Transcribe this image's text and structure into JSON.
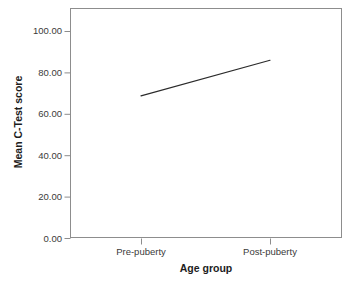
{
  "chart_data": {
    "type": "line",
    "title": "",
    "subtitle": "",
    "xlabel": "Age group",
    "ylabel": "Mean C-Test score",
    "categories": [
      "Pre-puberty",
      "Post-puberty"
    ],
    "series": [
      {
        "name": "Mean C-Test score",
        "values": [
          68.0,
          85.0
        ]
      }
    ],
    "ylim": [
      0.0,
      110.0
    ],
    "yticks": [
      0.0,
      20.0,
      40.0,
      60.0,
      80.0,
      100.0
    ],
    "ytick_labels": [
      "0.00",
      "20.00",
      "40.00",
      "60.00",
      "80.00",
      "100.00"
    ],
    "xtick_labels": [
      "Pre-puberty",
      "Post-puberty"
    ],
    "grid": false,
    "legend": false,
    "legend_position": "none",
    "line_color": "#2b2b2b",
    "frame_color": "#8d8d8d",
    "background_color": "#ffffff",
    "text_color": "#3a3a3a",
    "axis_title_color": "#1d1d1d"
  },
  "axis": {
    "y": {
      "title": "Mean C-Test score",
      "ticks": [
        {
          "label": "100.00",
          "value": 100.0
        },
        {
          "label": "80.00",
          "value": 80.0
        },
        {
          "label": "60.00",
          "value": 60.0
        },
        {
          "label": "40.00",
          "value": 40.0
        },
        {
          "label": "20.00",
          "value": 20.0
        },
        {
          "label": "0.00",
          "value": 0.0
        }
      ]
    },
    "x": {
      "title": "Age group",
      "ticks": [
        {
          "label": "Pre-puberty",
          "value": 0
        },
        {
          "label": "Post-puberty",
          "value": 1
        }
      ]
    }
  }
}
